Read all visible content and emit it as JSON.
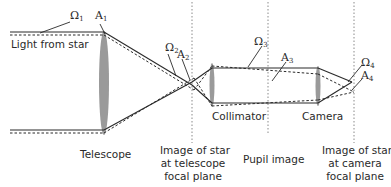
{
  "diagram": {
    "labels": {
      "light_from_star": "Light from star",
      "telescope": "Telescope",
      "image_telescope": [
        "Image of star",
        "at telescope",
        "focal plane"
      ],
      "collimator": "Collimator",
      "pupil_image": "Pupil image",
      "camera": "Camera",
      "image_camera": [
        "Image of star",
        "at camera",
        "focal plane"
      ]
    },
    "symbols": {
      "omega1": "Ω",
      "omega1_sub": "1",
      "a1": "A",
      "a1_sub": "1",
      "omega2": "Ω",
      "omega2_sub": "2",
      "a2": "A",
      "a2_sub": "2",
      "omega3": "Ω",
      "omega3_sub": "3",
      "a3": "A",
      "a3_sub": "3",
      "omega4": "Ω",
      "omega4_sub": "4",
      "a4": "A",
      "a4_sub": "4"
    },
    "colors": {
      "ray": "#2a2a2a",
      "lens": "#9a9a9a",
      "plane": "#8a8a8a"
    }
  }
}
